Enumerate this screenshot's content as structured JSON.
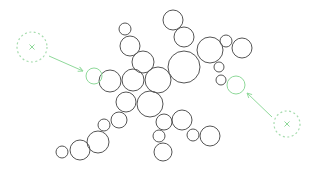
{
  "canvas": {
    "width": 311,
    "height": 172,
    "background": "#ffffff"
  },
  "colors": {
    "node_stroke": "#555555",
    "accent": "#8fd99a",
    "target": "#a6dcae"
  },
  "nodes": [
    {
      "cx": 125,
      "cy": 29,
      "r": 6
    },
    {
      "cx": 130,
      "cy": 46,
      "r": 10
    },
    {
      "cx": 143,
      "cy": 62,
      "r": 11
    },
    {
      "cx": 173,
      "cy": 20,
      "r": 10
    },
    {
      "cx": 184,
      "cy": 37,
      "r": 10
    },
    {
      "cx": 184,
      "cy": 67,
      "r": 16
    },
    {
      "cx": 210,
      "cy": 50,
      "r": 13
    },
    {
      "cx": 226,
      "cy": 41,
      "r": 6
    },
    {
      "cx": 242,
      "cy": 48,
      "r": 10
    },
    {
      "cx": 219,
      "cy": 67,
      "r": 5
    },
    {
      "cx": 221,
      "cy": 80,
      "r": 5
    },
    {
      "cx": 110,
      "cy": 81,
      "r": 11
    },
    {
      "cx": 133,
      "cy": 80,
      "r": 11
    },
    {
      "cx": 158,
      "cy": 80,
      "r": 13
    },
    {
      "cx": 126,
      "cy": 102,
      "r": 10
    },
    {
      "cx": 150,
      "cy": 104,
      "r": 13
    },
    {
      "cx": 119,
      "cy": 120,
      "r": 8
    },
    {
      "cx": 104,
      "cy": 125,
      "r": 6
    },
    {
      "cx": 98,
      "cy": 142,
      "r": 11
    },
    {
      "cx": 80,
      "cy": 150,
      "r": 10
    },
    {
      "cx": 62,
      "cy": 152,
      "r": 6
    },
    {
      "cx": 164,
      "cy": 122,
      "r": 8
    },
    {
      "cx": 182,
      "cy": 120,
      "r": 10
    },
    {
      "cx": 159,
      "cy": 136,
      "r": 6
    },
    {
      "cx": 163,
      "cy": 152,
      "r": 9
    },
    {
      "cx": 193,
      "cy": 135,
      "r": 6
    },
    {
      "cx": 210,
      "cy": 136,
      "r": 10
    }
  ],
  "endpoints": [
    {
      "name": "left-endpoint",
      "cx": 94,
      "cy": 76,
      "r": 8
    },
    {
      "name": "right-endpoint",
      "cx": 236,
      "cy": 85,
      "r": 9
    }
  ],
  "targets": [
    {
      "name": "left-target",
      "cx": 32,
      "cy": 47,
      "r": 15
    },
    {
      "name": "right-target",
      "cx": 287,
      "cy": 124,
      "r": 13
    }
  ],
  "arrows": [
    {
      "name": "left-arrow",
      "x1": 49,
      "y1": 56,
      "x2": 83,
      "y2": 71
    },
    {
      "name": "right-arrow",
      "x1": 272,
      "y1": 117,
      "x2": 247,
      "y2": 93
    }
  ]
}
